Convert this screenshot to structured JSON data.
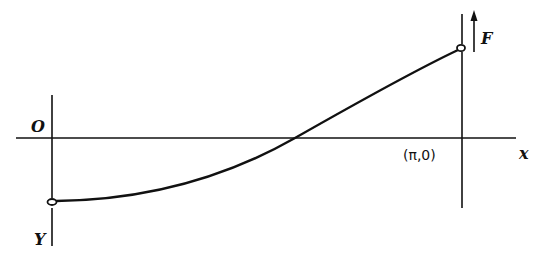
{
  "diagram": {
    "labels": {
      "origin": "O",
      "y_axis": "Y",
      "force": "F",
      "x_axis": "x",
      "end_point": "(π,0)"
    },
    "colors": {
      "ink": "#111111",
      "background": "#ffffff"
    },
    "elements": {
      "x_axis": {
        "from": [
          16,
          138
        ],
        "to": [
          516,
          138
        ]
      },
      "left_support_line": {
        "x": 52,
        "top": 95,
        "bottom": 246
      },
      "right_support_line": {
        "x": 462,
        "top": 14,
        "bottom": 208
      },
      "left_ring": {
        "cx": 52,
        "cy": 202
      },
      "right_ring": {
        "cx": 461,
        "cy": 48
      },
      "curve_zero_crossing_x": 295,
      "force_arrow": {
        "x": 474,
        "tail_y": 52,
        "head_y": 11
      }
    }
  }
}
